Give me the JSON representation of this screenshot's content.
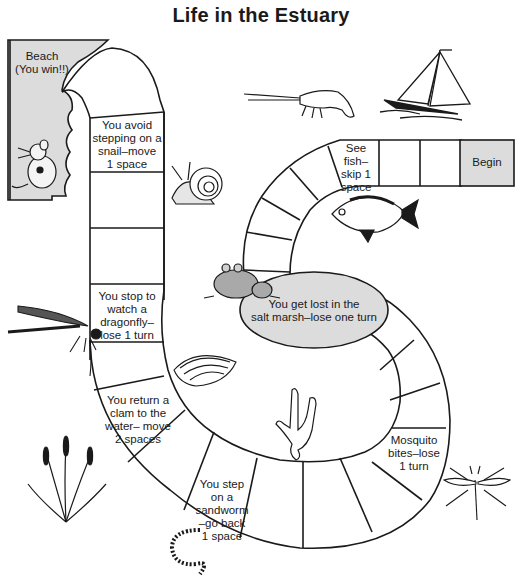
{
  "title": "Life in the Estuary",
  "colors": {
    "ink": "#1a1a1a",
    "shaded_space": "#dcdcdc",
    "background": "#ffffff"
  },
  "spaces": {
    "finish": "Beach\n(You win!!)",
    "snail": "You avoid stepping on a snail–move 1 space",
    "dragonfly": "You stop to watch a dragonfly–lose 1 turn",
    "clam": "You return a clam to the water– move 2 spaces",
    "sandworm": "You step on a sandworm –go back 1 space",
    "mosquito": "Mosquito bites–lose 1 turn",
    "marsh": "You get lost in the salt marsh–lose one turn",
    "fish": "See fish– skip 1 space",
    "start": "Begin"
  },
  "labels": {
    "finish_l1": "Beach",
    "finish_l2": "(You win!!)",
    "snail_l1": "You avoid",
    "snail_l2": "stepping on a",
    "snail_l3": "snail–move",
    "snail_l4": "1 space",
    "dragonfly_l1": "You stop to",
    "dragonfly_l2": "watch a",
    "dragonfly_l3": "dragonfly–",
    "dragonfly_l4": "lose 1 turn",
    "clam_l1": "You return a",
    "clam_l2": "clam to the",
    "clam_l3": "water– move",
    "clam_l4": "2 spaces",
    "sandworm_l1": "You step",
    "sandworm_l2": "on a sandworm",
    "sandworm_l3": "–go back",
    "sandworm_l4": "1 space",
    "mosquito_l1": "Mosquito",
    "mosquito_l2": "bites–lose",
    "mosquito_l3": "1 turn",
    "marsh_l1": "You get lost in the",
    "marsh_l2": "salt marsh–lose one turn",
    "fish_l1": "See fish–",
    "fish_l2": "skip 1",
    "fish_l3": "space",
    "start": "Begin"
  },
  "illustrations": [
    "mouse",
    "snail",
    "shrimp",
    "sailboat",
    "fish",
    "frog",
    "dragonfly",
    "clam",
    "coral",
    "cattails",
    "sandworm",
    "mosquito"
  ]
}
